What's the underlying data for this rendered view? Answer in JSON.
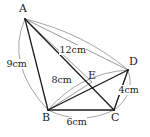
{
  "figure": {
    "background_color": "#ffffff",
    "stroke_color": "#1c1c1c",
    "arc_color": "#8a8a8a",
    "vertices": [
      {
        "id": "A",
        "label": "A",
        "x": 25,
        "y": 19,
        "label_x": 19,
        "label_y": 4
      },
      {
        "id": "B",
        "label": "B",
        "x": 48,
        "y": 110,
        "label_x": 42,
        "label_y": 115
      },
      {
        "id": "C",
        "label": "C",
        "x": 114,
        "y": 110,
        "label_x": 112,
        "label_y": 115
      },
      {
        "id": "D",
        "label": "D",
        "x": 128,
        "y": 70,
        "label_x": 130,
        "label_y": 57
      },
      {
        "id": "E",
        "label": "E",
        "x": 92,
        "y": 82,
        "label_x": 88,
        "label_y": 72
      }
    ],
    "segments": [
      {
        "id": "AB",
        "from": "A",
        "to": "B",
        "width": 1.3
      },
      {
        "id": "AC",
        "from": "A",
        "to": "C",
        "width": 1.3
      },
      {
        "id": "AD",
        "from": "A",
        "to": "D",
        "width": 0.7
      },
      {
        "id": "AE",
        "from": "A",
        "to": "E",
        "width": 0.7
      },
      {
        "id": "BC",
        "from": "B",
        "to": "C",
        "width": 1.3
      },
      {
        "id": "BD",
        "from": "B",
        "to": "D",
        "width": 1.3
      },
      {
        "id": "BE",
        "from": "B",
        "to": "E",
        "width": 0.7
      },
      {
        "id": "CD",
        "from": "C",
        "to": "D",
        "width": 1.3
      },
      {
        "id": "DC2",
        "from": "D",
        "to": "C",
        "width": 0.7
      }
    ],
    "measurements": [
      {
        "id": "AB",
        "text": "9cm",
        "x": 8,
        "y": 63,
        "arc_from": "A",
        "arc_to": "B",
        "bulge": -13
      },
      {
        "id": "AD",
        "text": "12cm",
        "x": 61,
        "y": 50,
        "arc_from": "A",
        "arc_to": "D",
        "bulge": -14
      },
      {
        "id": "BD",
        "text": "8cm",
        "x": 52,
        "y": 78,
        "arc_from": "B",
        "arc_to": "D",
        "bulge": -11
      },
      {
        "id": "DC",
        "text": "4cm",
        "x": 120,
        "y": 89,
        "arc_from": "D",
        "arc_to": "C",
        "bulge": -10
      },
      {
        "id": "BC",
        "text": "6cm",
        "x": 68,
        "y": 118,
        "arc_from": "B",
        "arc_to": "C",
        "bulge": -9
      }
    ]
  }
}
